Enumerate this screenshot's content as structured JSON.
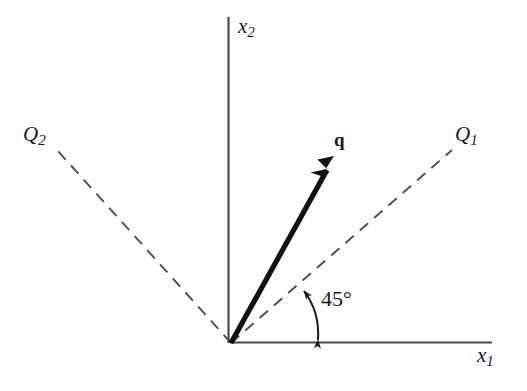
{
  "figure": {
    "background_color": "#ffffff",
    "stroke_color": "#3a3a3a",
    "vector_color": "#111111",
    "width": 527,
    "height": 391
  },
  "axes": {
    "x_axis": {
      "label": "x",
      "subscript": "1",
      "name": "horizontal-axis",
      "from": [
        231,
        343
      ],
      "to": [
        492,
        342
      ]
    },
    "y_axis": {
      "label": "x",
      "subscript": "2",
      "name": "vertical-axis",
      "from": [
        228,
        343
      ],
      "to": [
        228,
        17
      ]
    },
    "origin": [
      231,
      343
    ]
  },
  "lines": [
    {
      "name": "q1-axis-dashed",
      "label": "Q",
      "subscript": "1",
      "style": "dashed",
      "from": [
        231,
        343
      ],
      "to": [
        452,
        150
      ],
      "angle_deg": 45
    },
    {
      "name": "q2-axis-dashed",
      "label": "Q",
      "subscript": "2",
      "style": "dashed",
      "from": [
        231,
        343
      ],
      "to": [
        57,
        150
      ],
      "angle_deg": 135
    }
  ],
  "vector": {
    "name": "q-vector",
    "label": "q",
    "style": "solid-bold-arrow",
    "from": [
      231,
      343
    ],
    "to": [
      334,
      157
    ]
  },
  "angle_annotation": {
    "name": "angle-45",
    "text": "45°",
    "value": 45,
    "unit": "degrees",
    "between": [
      "x1-axis",
      "Q1-axis"
    ],
    "arc_from": [
      318,
      343
    ],
    "arc_to": [
      303,
      289
    ],
    "double_headed": true
  }
}
